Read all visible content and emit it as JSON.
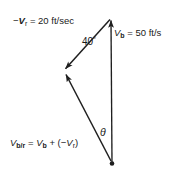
{
  "figure": {
    "type": "vector-diagram",
    "background_color": "#ffffff",
    "stroke_color": "#1f1f1f",
    "text_color": "#1a1a1a"
  },
  "labels": {
    "minus_vr": {
      "prefix": "−",
      "symbol": "V",
      "subscript": "r",
      "equals": " = ",
      "value": "20",
      "unit": " ft/sec"
    },
    "vb": {
      "symbol": "V",
      "subscript": "b",
      "equals": " = ",
      "value": "50",
      "unit": " ft/s"
    },
    "angle_40": {
      "value": "40",
      "degree": "°"
    },
    "theta": {
      "symbol": "θ"
    },
    "resultant": {
      "symbol": "V",
      "subscript": "b/r",
      "equals": " = ",
      "term1_symbol": "V",
      "term1_subscript": "b",
      "plus": " + (",
      "term2_prefix": "−",
      "term2_symbol": "V",
      "term2_subscript": "r",
      "close": ")"
    }
  },
  "geometry": {
    "apex": {
      "x": 111,
      "y": 18
    },
    "left_vertex": {
      "x": 63,
      "y": 71
    },
    "bottom_vertex": {
      "x": 112,
      "y": 163
    },
    "vectors": [
      {
        "name": "V_b",
        "from": "bottom_vertex",
        "to": "apex",
        "arrow_at": "apex"
      },
      {
        "name": "-V_r",
        "from": "apex",
        "to": "left_vertex",
        "arrow_at": "left_vertex"
      },
      {
        "name": "V_b/r",
        "from": "bottom_vertex",
        "to": "left_vertex",
        "arrow_at": "left_vertex"
      }
    ],
    "angles": [
      {
        "name": "40-degree",
        "at": "apex",
        "value": 40
      },
      {
        "name": "theta",
        "at": "bottom_vertex",
        "value": null
      }
    ]
  }
}
